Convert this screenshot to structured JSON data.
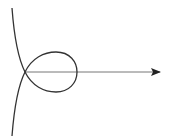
{
  "diagram": {
    "type": "curve-with-axis",
    "colors": {
      "background": "#ffffff",
      "curve": "#333333",
      "axis": "#777777",
      "arrowhead": "#222222"
    },
    "axis": {
      "x1": 25,
      "y1": 72,
      "x2": 160,
      "y2": 72,
      "direction": "right"
    },
    "curve": {
      "node_point": [
        25,
        72
      ],
      "loop_extent": {
        "top": 52,
        "bottom": 92,
        "right": 77
      },
      "upper_branch_end": [
        12,
        8
      ],
      "lower_branch_end": [
        12,
        136
      ]
    },
    "labels": []
  }
}
